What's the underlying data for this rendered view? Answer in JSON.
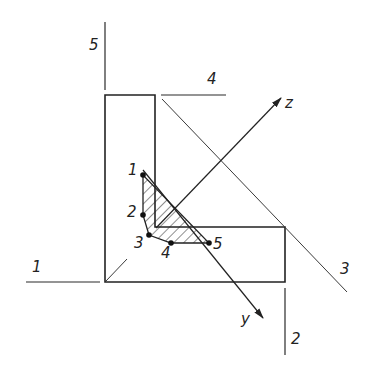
{
  "diagram": {
    "type": "angle-section-principal-axes",
    "colors": {
      "ink": "#222222",
      "background": "#ffffff"
    },
    "reference_lines": [
      {
        "id": "1",
        "label": "1"
      },
      {
        "id": "2",
        "label": "2"
      },
      {
        "id": "3",
        "label": "3"
      },
      {
        "id": "4",
        "label": "4"
      },
      {
        "id": "5",
        "label": "5"
      }
    ],
    "axes": [
      {
        "id": "z",
        "label": "z"
      },
      {
        "id": "y",
        "label": "y"
      }
    ],
    "points": [
      {
        "id": "1",
        "label": "1"
      },
      {
        "id": "2",
        "label": "2"
      },
      {
        "id": "3",
        "label": "3"
      },
      {
        "id": "4",
        "label": "4"
      },
      {
        "id": "5",
        "label": "5"
      }
    ],
    "hatched_region": "polygon through points 1-2-3-4-5"
  }
}
